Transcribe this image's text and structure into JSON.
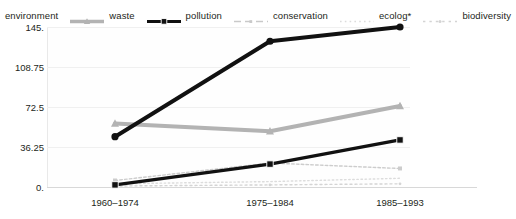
{
  "chart_data": {
    "type": "line",
    "title": "",
    "xlabel": "",
    "ylabel": "",
    "categories": [
      "1960–1974",
      "1975–1984",
      "1985–1993"
    ],
    "ylim": [
      0,
      145
    ],
    "yticks": [
      "0.",
      "36.25",
      "72.5",
      "108.75",
      "145."
    ],
    "ytick_values": [
      0,
      36.25,
      72.5,
      108.75,
      145
    ],
    "grid": true,
    "legend_position": "top",
    "series": [
      {
        "name": "environment",
        "values": [
          45,
          132,
          145
        ],
        "color": "#111111",
        "style": "solid-thick-marker"
      },
      {
        "name": "waste",
        "values": [
          57,
          50,
          73
        ],
        "color": "#b3b3b3",
        "style": "solid-thick-marker"
      },
      {
        "name": "pollution",
        "values": [
          1,
          20,
          42
        ],
        "color": "#111111",
        "style": "solid-medium-marker"
      },
      {
        "name": "conservation",
        "values": [
          5,
          21,
          16
        ],
        "color": "#cccccc",
        "style": "dashed-thin"
      },
      {
        "name": "ecolog*",
        "values": [
          2,
          4,
          7
        ],
        "color": "#dcdcdc",
        "style": "dotted-thin"
      },
      {
        "name": "biodiversity",
        "values": [
          0,
          1,
          2
        ],
        "color": "#d4d4d4",
        "style": "dotted-thin"
      }
    ]
  },
  "legend": {
    "items": [
      {
        "label": "environment",
        "swatch": "legend-swatch-environment"
      },
      {
        "label": "waste",
        "swatch": "legend-swatch-waste"
      },
      {
        "label": "pollution",
        "swatch": "legend-swatch-pollution"
      },
      {
        "label": "conservation",
        "swatch": "legend-swatch-conservation"
      },
      {
        "label": "ecolog*",
        "swatch": "legend-swatch-ecolog"
      },
      {
        "label": "biodiversity",
        "swatch": "legend-swatch-biodiversity"
      }
    ]
  },
  "axes": {
    "y_tick_labels": [
      "145.",
      "108.75",
      "72.5",
      "36.25",
      "0."
    ],
    "x_tick_labels": [
      "1960–1974",
      "1975–1984",
      "1985–1993"
    ]
  },
  "colors": {
    "dark": "#111111",
    "mid_gray": "#b3b3b3",
    "light_gray": "#d4d4d4",
    "grid": "#f0f0f0",
    "axis": "#d8d8d8",
    "text": "#231f20",
    "background": "#ffffff"
  }
}
